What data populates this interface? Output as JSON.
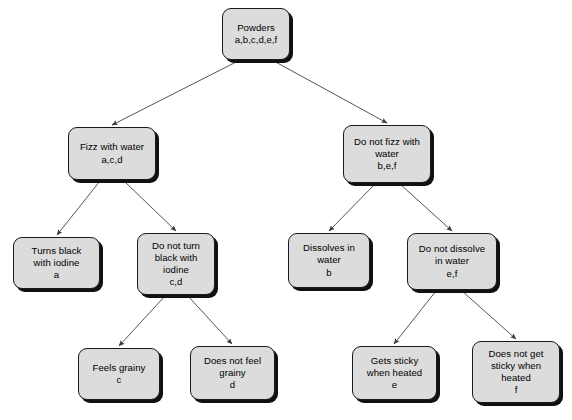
{
  "diagram": {
    "style": {
      "node_fill": "#dcdcdc",
      "node_border": "#1a1a1a",
      "node_shadow": "#111111",
      "edge_color": "#555555",
      "background": "#ffffff",
      "text_color": "#000000"
    },
    "nodes": [
      {
        "id": "root",
        "label": "Powders\na,b,c,d,e,f",
        "name": "node-powders",
        "x": 222,
        "y": 8,
        "w": 68,
        "h": 52
      },
      {
        "id": "fizz",
        "label": "Fizz with water\na,c,d",
        "name": "node-fizz-with-water",
        "x": 68,
        "y": 127,
        "w": 88,
        "h": 53
      },
      {
        "id": "nofizz",
        "label": "Do not fizz with\nwater\nb,e,f",
        "name": "node-do-not-fizz-with-water",
        "x": 343,
        "y": 125,
        "w": 88,
        "h": 58
      },
      {
        "id": "black",
        "label": "Turns black\nwith iodine\na",
        "name": "node-turns-black-with-iodine",
        "x": 13,
        "y": 237,
        "w": 87,
        "h": 52
      },
      {
        "id": "noblack",
        "label": "Do not turn\nblack with\niodine\nc,d",
        "name": "node-do-not-turn-black-with-iodine",
        "x": 137,
        "y": 233,
        "w": 78,
        "h": 62
      },
      {
        "id": "dissolve",
        "label": "Dissolves in\nwater\nb",
        "name": "node-dissolves-in-water",
        "x": 288,
        "y": 233,
        "w": 82,
        "h": 55
      },
      {
        "id": "nodissolve",
        "label": "Do not dissolve\nin water\ne,f",
        "name": "node-do-not-dissolve-in-water",
        "x": 407,
        "y": 233,
        "w": 90,
        "h": 57
      },
      {
        "id": "grainy",
        "label": "Feels grainy\nc",
        "name": "node-feels-grainy",
        "x": 78,
        "y": 348,
        "w": 82,
        "h": 52
      },
      {
        "id": "nograiny",
        "label": "Does not feel\ngrainy\nd",
        "name": "node-does-not-feel-grainy",
        "x": 190,
        "y": 346,
        "w": 85,
        "h": 54
      },
      {
        "id": "sticky",
        "label": "Gets sticky\nwhen heated\ne",
        "name": "node-gets-sticky-when-heated",
        "x": 352,
        "y": 346,
        "w": 85,
        "h": 54
      },
      {
        "id": "nosticky",
        "label": "Does not get\nsticky when\nheated\nf",
        "name": "node-does-not-get-sticky-when-heated",
        "x": 472,
        "y": 341,
        "w": 88,
        "h": 62
      }
    ],
    "edges": [
      {
        "name": "edge-root-to-fizz",
        "from": "root",
        "to": "fizz",
        "x1": 240,
        "y1": 60,
        "x2": 112,
        "y2": 125
      },
      {
        "name": "edge-root-to-nofizz",
        "from": "root",
        "to": "nofizz",
        "x1": 272,
        "y1": 60,
        "x2": 387,
        "y2": 123
      },
      {
        "name": "edge-fizz-to-black",
        "from": "fizz",
        "to": "black",
        "x1": 100,
        "y1": 181,
        "x2": 57,
        "y2": 235
      },
      {
        "name": "edge-fizz-to-noblack",
        "from": "fizz",
        "to": "noblack",
        "x1": 124,
        "y1": 181,
        "x2": 176,
        "y2": 231
      },
      {
        "name": "edge-nofizz-to-dissolve",
        "from": "nofizz",
        "to": "dissolve",
        "x1": 375,
        "y1": 184,
        "x2": 329,
        "y2": 231
      },
      {
        "name": "edge-nofizz-to-nodissolve",
        "from": "nofizz",
        "to": "nodissolve",
        "x1": 400,
        "y1": 184,
        "x2": 452,
        "y2": 231
      },
      {
        "name": "edge-noblack-to-grainy",
        "from": "noblack",
        "to": "grainy",
        "x1": 165,
        "y1": 296,
        "x2": 119,
        "y2": 346
      },
      {
        "name": "edge-noblack-to-nograiny",
        "from": "noblack",
        "to": "nograiny",
        "x1": 188,
        "y1": 296,
        "x2": 232,
        "y2": 344
      },
      {
        "name": "edge-nodissolve-to-sticky",
        "from": "nodissolve",
        "to": "sticky",
        "x1": 436,
        "y1": 291,
        "x2": 394,
        "y2": 344
      },
      {
        "name": "edge-nodissolve-to-nosticky",
        "from": "nodissolve",
        "to": "nosticky",
        "x1": 462,
        "y1": 291,
        "x2": 516,
        "y2": 339
      }
    ]
  }
}
